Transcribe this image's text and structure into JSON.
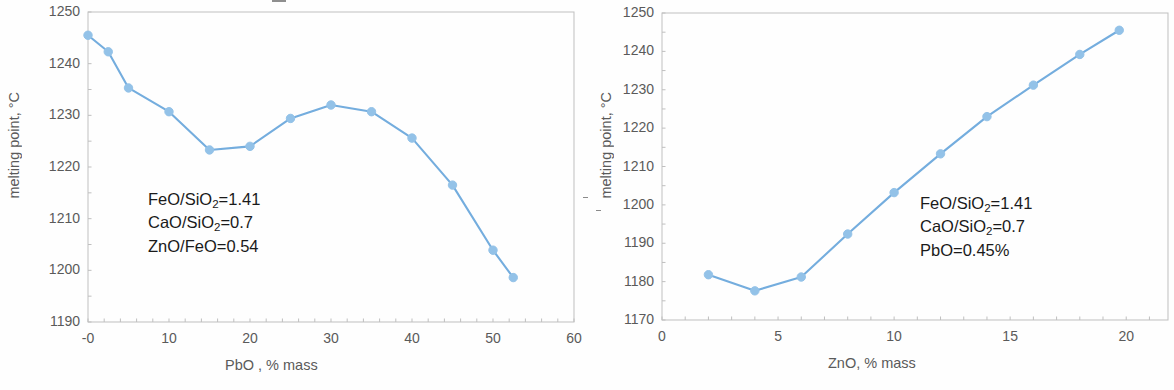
{
  "chart_data": [
    {
      "id": "left",
      "type": "line",
      "title": "",
      "xlabel": "PbO , % mass",
      "ylabel": "melting point, °C",
      "xlim": [
        0,
        60
      ],
      "ylim": [
        1190,
        1250
      ],
      "xticks": [
        0,
        10,
        20,
        30,
        40,
        50,
        60
      ],
      "xtick_labels": [
        "-0",
        "10",
        "20",
        "30",
        "40",
        "50",
        "60"
      ],
      "yticks": [
        1190,
        1200,
        1210,
        1220,
        1230,
        1240,
        1250
      ],
      "ytick_labels": [
        "1190",
        "1200",
        "1210",
        "1220",
        "1230",
        "1240",
        "1250"
      ],
      "grid": false,
      "legend": "none",
      "marker": "circle",
      "series_color": "#74ADDE",
      "marker_color": "#93C2E8",
      "x": [
        0,
        2.5,
        5,
        10,
        15,
        20,
        25,
        30,
        35,
        40,
        45,
        50,
        52.5
      ],
      "y": [
        1245.5,
        1242.3,
        1235.3,
        1230.7,
        1223.3,
        1224.0,
        1229.4,
        1232.0,
        1230.7,
        1225.6,
        1216.5,
        1203.9,
        1198.6
      ],
      "annotations": [
        "FeO/SiO2=1.41",
        "CaO/SiO2=0.7",
        "ZnO/FeO=0.54"
      ]
    },
    {
      "id": "right",
      "type": "line",
      "title": "",
      "xlabel": "ZnO, % mass",
      "ylabel": "melting point, °C",
      "xlim": [
        0,
        21.8
      ],
      "ylim": [
        1170,
        1250
      ],
      "xticks": [
        0,
        5,
        10,
        15,
        20
      ],
      "xtick_labels": [
        "0",
        "5",
        "10",
        "15",
        "20"
      ],
      "yticks": [
        1170,
        1180,
        1190,
        1200,
        1210,
        1220,
        1230,
        1240,
        1250
      ],
      "ytick_labels": [
        "1170",
        "1180",
        "1190",
        "1200",
        "1210",
        "1220",
        "1230",
        "1240",
        "1250"
      ],
      "grid": false,
      "legend": "none",
      "marker": "circle",
      "series_color": "#74ADDE",
      "marker_color": "#93C2E8",
      "x": [
        2,
        4,
        6,
        8,
        10,
        12,
        14,
        16,
        18,
        19.7
      ],
      "y": [
        1181.8,
        1177.6,
        1181.2,
        1192.4,
        1203.2,
        1213.3,
        1223.0,
        1231.2,
        1239.2,
        1245.5
      ],
      "annotations": [
        "FeO/SiO2=1.41",
        "CaO/SiO2=0.7",
        "PbO=0.45%"
      ]
    }
  ],
  "left": {
    "ylabel": "melting point, °C",
    "xlabel": "PbO , % mass",
    "annot": {
      "line1_pre": "FeO/SiO",
      "line1_sub": "2",
      "line1_post": "=1.41",
      "line2_pre": "CaO/SiO",
      "line2_sub": "2",
      "line2_post": "=0.7",
      "line3": "ZnO/FeO=0.54"
    }
  },
  "right": {
    "ylabel": "melting point, °C",
    "xlabel": "ZnO, % mass",
    "annot": {
      "line1_pre": "FeO/SiO",
      "line1_sub": "2",
      "line1_post": "=1.41",
      "line2_pre": "CaO/SiO",
      "line2_sub": "2",
      "line2_post": "=0.7",
      "line3": "PbO=0.45%"
    }
  },
  "style": {
    "line_color": "#74ADDE",
    "marker_fill": "#93C2E8",
    "axis_color": "#BFBFBF",
    "text_color": "#595959"
  }
}
